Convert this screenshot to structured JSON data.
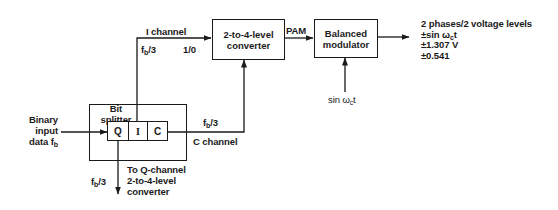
{
  "diagram": {
    "type": "block-diagram",
    "input": {
      "line1": "Binary",
      "line2": "input",
      "line3": "data f",
      "sub": "b"
    },
    "bit_splitter": {
      "line1": "Bit",
      "line2": "splitter",
      "cells": [
        "Q",
        "I",
        "C"
      ]
    },
    "i_channel": {
      "label": "I channel",
      "rate": "f",
      "rate_sub": "b",
      "rate_suffix": "/3",
      "logic": "1/0"
    },
    "c_channel": {
      "label": "C channel",
      "rate": "f",
      "rate_sub": "b",
      "rate_suffix": "/3"
    },
    "q_channel": {
      "rate": "f",
      "rate_sub": "b",
      "rate_suffix": "/3",
      "line1": "To Q-channel",
      "line2": "2-to-4-level",
      "line3": "converter"
    },
    "converter": {
      "line1": "2-to-4-level",
      "line2": "converter"
    },
    "pam_label": "PAM",
    "modulator": {
      "line1": "Balanced",
      "line2": "modulator"
    },
    "carrier": {
      "prefix": "sin ω",
      "sub": "c",
      "suffix": "t"
    },
    "output": {
      "line1": "2 phases/2 voltage levels",
      "line2_prefix": "±sin ω",
      "line2_sub": "c",
      "line2_suffix": "t",
      "line3": "±1.307 V",
      "line4": "±0.541"
    }
  }
}
